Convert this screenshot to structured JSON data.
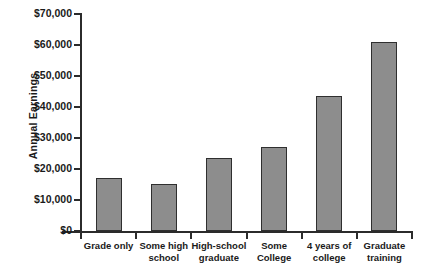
{
  "chart_data": {
    "type": "bar",
    "title": "",
    "xlabel": "",
    "ylabel": "Annual Earnings",
    "categories": [
      "Grade only",
      "Some high school",
      "High-school graduate",
      "Some College",
      "4 years of college",
      "Graduate training"
    ],
    "values": [
      17000,
      15300,
      23500,
      27000,
      43600,
      61000
    ],
    "ylim": [
      0,
      70000
    ],
    "ytick_values": [
      0,
      10000,
      20000,
      30000,
      40000,
      50000,
      60000,
      70000
    ],
    "ytick_labels": [
      "$0",
      "$10,000",
      "$20,000",
      "$30,000",
      "$40,000",
      "$50,000",
      "$60,000",
      "$70,000"
    ],
    "grid": false,
    "legend": null,
    "bar_color": "#8d8d8d",
    "bar_border_color": "#2f2f2f",
    "axis_color": "#2b2b2b",
    "background_color": "#ffffff"
  },
  "category_lines": [
    [
      "Grade only"
    ],
    [
      "Some high",
      "school"
    ],
    [
      "High-school",
      "graduate"
    ],
    [
      "Some",
      "College"
    ],
    [
      "4 years of",
      "college"
    ],
    [
      "Graduate",
      "training"
    ]
  ]
}
